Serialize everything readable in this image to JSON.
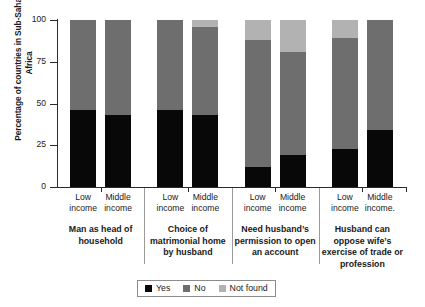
{
  "chart_data": {
    "type": "bar",
    "title": "",
    "subtitle": "",
    "xlabel": "",
    "ylabel": "Percentage of countries in Sub-Saharan Africa",
    "ylim": [
      0,
      100
    ],
    "yticks": [
      0,
      25,
      50,
      75,
      100
    ],
    "ytick_labels": [
      "0",
      "25",
      "50",
      "75",
      "100"
    ],
    "grid": false,
    "stacked": true,
    "legend_position": "bottom",
    "legend": [
      "Yes",
      "No",
      "Not found"
    ],
    "colors": {
      "Yes": "#080808",
      "No": "#6e6e6e",
      "Not found": "#b2b2b2"
    },
    "groups": [
      "Man as head of household",
      "Choice of matrimonial home by husband",
      "Need husband's permission to open an account",
      "Husband can oppose wife's exercise of trade or profession"
    ],
    "categories": [
      "Low income",
      "Middle income",
      "Low income",
      "Middle income",
      "Low income",
      "Middle income",
      "Low income",
      "Middle income"
    ],
    "series": [
      {
        "name": "Yes",
        "values": [
          46,
          43,
          46,
          43,
          12,
          19,
          23,
          34
        ]
      },
      {
        "name": "No",
        "values": [
          54,
          57,
          54,
          53,
          76,
          62,
          66,
          66
        ]
      },
      {
        "name": "Not found",
        "values": [
          0,
          0,
          0,
          4,
          12,
          19,
          11,
          0
        ]
      }
    ]
  },
  "axis": {
    "y_title": "Percentage of countries in Sub-Saharan Africa",
    "ticks": [
      {
        "label": "100",
        "value": 100
      },
      {
        "label": "75",
        "value": 75
      },
      {
        "label": "50",
        "value": 50
      },
      {
        "label": "25",
        "value": 25
      },
      {
        "label": "0",
        "value": 0
      }
    ]
  },
  "bars": [
    {
      "income": "Low income",
      "yes": 46,
      "no": 54,
      "not_found": 0
    },
    {
      "income": "Middle income",
      "yes": 43,
      "no": 57,
      "not_found": 0
    },
    {
      "income": "Low income",
      "yes": 46,
      "no": 54,
      "not_found": 0
    },
    {
      "income": "Middle income",
      "yes": 43,
      "no": 53,
      "not_found": 4
    },
    {
      "income": "Low income",
      "yes": 12,
      "no": 76,
      "not_found": 12
    },
    {
      "income": "Middle income",
      "yes": 19,
      "no": 62,
      "not_found": 19
    },
    {
      "income": "Low income",
      "yes": 23,
      "no": 66,
      "not_found": 11
    },
    {
      "income": "Middle income",
      "yes": 34,
      "no": 66,
      "not_found": 0
    }
  ],
  "xlabels": [
    {
      "line1": "Low",
      "line2": "income"
    },
    {
      "line1": "Middle",
      "line2": "income"
    },
    {
      "line1": "Low",
      "line2": "income"
    },
    {
      "line1": "Middle",
      "line2": "income"
    },
    {
      "line1": "Low",
      "line2": "income"
    },
    {
      "line1": "Middle",
      "line2": "income"
    },
    {
      "line1": "Low",
      "line2": "income"
    },
    {
      "line1": "Middle",
      "line2": "income."
    }
  ],
  "group_labels": [
    "Man as head of household",
    "Choice of matrimonial home by husband",
    "Need husband’s permission to open an account",
    "Husband can oppose wife’s exercise of trade or profession"
  ],
  "legend": {
    "items": [
      {
        "label": "Yes",
        "color": "#080808"
      },
      {
        "label": "No",
        "color": "#6e6e6e"
      },
      {
        "label": "Not found",
        "color": "#b2b2b2"
      }
    ]
  }
}
